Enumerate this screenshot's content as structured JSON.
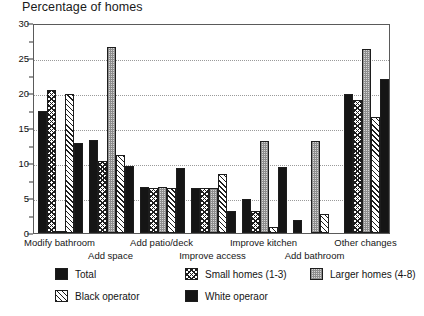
{
  "chart_data": {
    "type": "bar",
    "title": "Percentage of homes",
    "xlabel": "",
    "ylabel": "",
    "ylim": [
      0,
      30
    ],
    "ytick_labels": [
      "0",
      "5",
      "10",
      "15",
      "20",
      "25",
      "30"
    ],
    "ytick_values": [
      0,
      5,
      10,
      15,
      20,
      25,
      30
    ],
    "minor_tick_values": [
      2.5,
      7.5,
      12.5,
      17.5,
      22.5,
      27.5
    ],
    "grid": true,
    "grid_axis": "y",
    "legend_position": "below",
    "categories": [
      "Modify bathroom",
      "Add space",
      "Add patio/deck",
      "Improve access",
      "Improve kitchen",
      "Add bathroom",
      "Other changes"
    ],
    "series": [
      {
        "name": "Total",
        "pattern": "solid-black",
        "values": [
          17.4,
          13.3,
          6.6,
          6.4,
          4.8,
          1.8,
          19.8
        ]
      },
      {
        "name": "Small homes (1-3)",
        "pattern": "cross-hatch",
        "values": [
          20.4,
          10.3,
          6.5,
          6.4,
          3.2,
          0.0,
          19.0
        ]
      },
      {
        "name": "Larger homes (4-8)",
        "pattern": "light-dotted",
        "values": [
          0.1,
          26.6,
          6.6,
          6.4,
          13.2,
          13.2,
          26.3
        ]
      },
      {
        "name": "Black operator",
        "pattern": "diagonal-hatch",
        "values": [
          19.8,
          11.2,
          6.5,
          8.4,
          0.8,
          2.7,
          16.6
        ]
      },
      {
        "name": "White operaor",
        "pattern": "solid-black",
        "values": [
          12.8,
          9.6,
          9.3,
          3.2,
          9.4,
          0.0,
          22.0
        ]
      }
    ]
  },
  "legend": {
    "items": [
      {
        "label": "Total"
      },
      {
        "label": "Small homes (1-3)"
      },
      {
        "label": "Larger homes (4-8)"
      },
      {
        "label": "Black operator"
      },
      {
        "label": "White operaor"
      }
    ]
  }
}
